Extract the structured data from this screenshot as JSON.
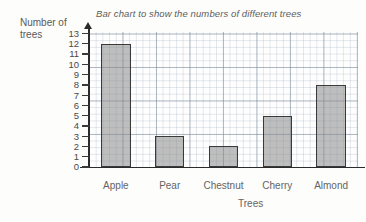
{
  "chart_data": {
    "type": "bar",
    "title": "Bar chart to show the numbers of different trees",
    "xlabel": "Trees",
    "ylabel": "Number of trees",
    "ylabel_line1": "Number of",
    "ylabel_line2": "trees",
    "categories": [
      "Apple",
      "Pear",
      "Chestnut",
      "Cherry",
      "Almond"
    ],
    "values": [
      12,
      3,
      2,
      5,
      8
    ],
    "ylim": [
      0,
      13
    ],
    "yticks": [
      13,
      12,
      11,
      10,
      9,
      8,
      7,
      6,
      5,
      4,
      3,
      2,
      1,
      0
    ],
    "ytick_labels": [
      "13",
      "12",
      "11",
      "10",
      "9",
      "8",
      "7",
      "6",
      "5",
      "4",
      "3",
      "2",
      "1",
      "0"
    ],
    "grid": true,
    "grid_style": "graph-paper",
    "legend": false,
    "bar_fill_color": "#888888",
    "bar_edge_color": "#3a3a3a",
    "axis_color": "#2b2b2b",
    "grid_color": "#96a5b4",
    "background_color": "#fdfdfb"
  }
}
